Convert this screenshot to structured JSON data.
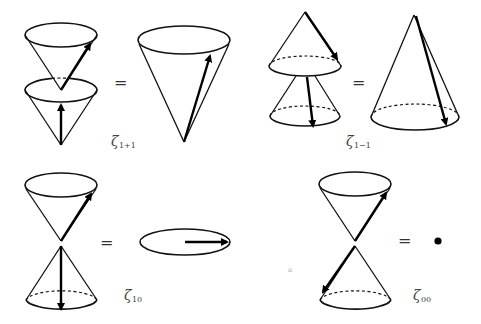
{
  "figure": {
    "panels": [
      {
        "id": "zeta_1p1",
        "symbol": "ζ",
        "subscript": "1+1",
        "equals": "=",
        "result": "single cone opening upward with arrow along the surface"
      },
      {
        "id": "zeta_1m1",
        "symbol": "ζ",
        "subscript": "1−1",
        "equals": "=",
        "result": "single cone opening downward with arrow along the surface"
      },
      {
        "id": "zeta_10",
        "symbol": "ζ",
        "subscript": "10",
        "equals": "=",
        "result": "flat disk with horizontal arrow"
      },
      {
        "id": "zeta_00",
        "symbol": "ζ",
        "subscript": "00",
        "equals": "=",
        "result": "point"
      }
    ],
    "stray_mark": "a"
  }
}
